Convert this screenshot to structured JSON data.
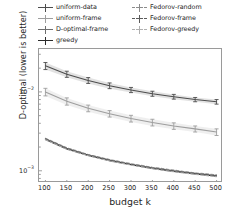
{
  "chart_data": {
    "type": "line",
    "title": "",
    "xlabel": "budget k",
    "ylabel": "D-optimal (lower is better)",
    "yscale": "log",
    "xscale": "linear",
    "xlim": [
      85,
      515
    ],
    "ylim": [
      0.0007,
      0.035
    ],
    "grid": false,
    "legend_position": "above-axes",
    "legend_columns": 2,
    "error_bars": true,
    "x": [
      100,
      150,
      200,
      250,
      300,
      350,
      400,
      450,
      500
    ],
    "xticks": [
      "100",
      "150",
      "200",
      "250",
      "300",
      "350",
      "400",
      "450",
      "500"
    ],
    "yticks": [
      "10⁻²",
      "10⁻³"
    ],
    "ytick_values": [
      0.01,
      0.001
    ],
    "series": [
      {
        "name": "uniform-data",
        "color": "#4d4d4d",
        "dash": "solid",
        "values": [
          0.0214,
          0.0168,
          0.014,
          0.012,
          0.0106,
          0.0095,
          0.0087,
          0.008,
          0.0075
        ],
        "yerr": [
          0.0022,
          0.0015,
          0.0012,
          0.001,
          0.0008,
          0.0007,
          0.0006,
          0.0005,
          0.0005
        ]
      },
      {
        "name": "uniform-frame",
        "color": "#9e9e9e",
        "dash": "solid",
        "values": [
          0.01,
          0.0076,
          0.0062,
          0.0053,
          0.0046,
          0.0041,
          0.0037,
          0.0034,
          0.0031
        ],
        "yerr": [
          0.0011,
          0.0008,
          0.0006,
          0.0005,
          0.00045,
          0.0004,
          0.00035,
          0.0003,
          0.0003
        ]
      },
      {
        "name": "D-optimal-frame",
        "color": "#6e6e6e",
        "dash": "solid",
        "values": [
          0.00255,
          0.00193,
          0.00159,
          0.00137,
          0.00121,
          0.00109,
          0.001,
          0.00093,
          0.00087
        ]
      },
      {
        "name": "greedy",
        "color": "#2b2b2b",
        "dash": "solid",
        "values": [
          0.0025,
          0.00189,
          0.00156,
          0.00134,
          0.00119,
          0.00107,
          0.00098,
          0.00091,
          0.00085
        ]
      },
      {
        "name": "Fedorov-random",
        "color": "#8c8c8c",
        "dash": "dashed",
        "values": [
          0.00258,
          0.00196,
          0.00161,
          0.00139,
          0.00123,
          0.00111,
          0.00102,
          0.00094,
          0.00089
        ]
      },
      {
        "name": "Fedorov-frame",
        "color": "#5a5a5a",
        "dash": "dashed",
        "values": [
          0.00253,
          0.00191,
          0.00158,
          0.00136,
          0.0012,
          0.00108,
          0.00099,
          0.00092,
          0.00086
        ]
      },
      {
        "name": "Fedorov-greedy",
        "color": "#b0b0b0",
        "dash": "dashed",
        "values": [
          0.00248,
          0.00187,
          0.00155,
          0.00133,
          0.00118,
          0.00106,
          0.00097,
          0.0009,
          0.00084
        ]
      }
    ]
  },
  "legend": {
    "column_a": [
      {
        "label": "uniform-data",
        "color": "#4d4d4d",
        "dash": "solid"
      },
      {
        "label": "uniform-frame",
        "color": "#9e9e9e",
        "dash": "solid"
      },
      {
        "label": "D-optimal-frame",
        "color": "#6e6e6e",
        "dash": "solid"
      },
      {
        "label": "greedy",
        "color": "#2b2b2b",
        "dash": "solid"
      }
    ],
    "column_b": [
      {
        "label": "Fedorov-random",
        "color": "#8c8c8c",
        "dash": "dashed"
      },
      {
        "label": "Fedorov-frame",
        "color": "#5a5a5a",
        "dash": "dashed"
      },
      {
        "label": "Fedorov-greedy",
        "color": "#b0b0b0",
        "dash": "dashed"
      }
    ]
  },
  "axes": {
    "xlabel": "budget k",
    "ylabel": "D-optimal (lower is better)"
  }
}
